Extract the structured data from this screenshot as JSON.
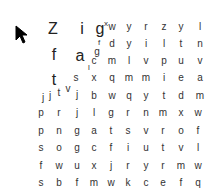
{
  "game": {
    "type": "letter-grid",
    "cursor": "arrow-cursor-icon",
    "floating_letters": [
      {
        "ch": "Z",
        "x": 53,
        "y": 29,
        "size": "l"
      },
      {
        "ch": "i",
        "x": 82,
        "y": 29,
        "size": "l"
      },
      {
        "ch": "g",
        "x": 100,
        "y": 29,
        "size": "l"
      },
      {
        "ch": "x",
        "x": 106,
        "y": 24,
        "size": "s"
      },
      {
        "ch": "f",
        "x": 54,
        "y": 55,
        "size": "l"
      },
      {
        "ch": "a",
        "x": 80,
        "y": 56,
        "size": "l"
      },
      {
        "ch": "g",
        "x": 97,
        "y": 52,
        "size": "m"
      },
      {
        "ch": "f",
        "x": 99,
        "y": 43,
        "size": "s"
      },
      {
        "ch": "l",
        "x": 89,
        "y": 68,
        "size": "s"
      },
      {
        "ch": "t",
        "x": 54,
        "y": 80,
        "size": "l"
      },
      {
        "ch": "s",
        "x": 76,
        "y": 78,
        "size": "m"
      },
      {
        "ch": "j",
        "x": 43,
        "y": 98,
        "size": "m"
      },
      {
        "ch": "j",
        "x": 50,
        "y": 96,
        "size": "m"
      },
      {
        "ch": "t",
        "x": 59,
        "y": 93,
        "size": "m"
      },
      {
        "ch": "v",
        "x": 68,
        "y": 89,
        "size": "m"
      },
      {
        "ch": "j",
        "x": 77,
        "y": 95,
        "size": "m"
      }
    ],
    "grid_cols_x": [
      94,
      112,
      129,
      146,
      164,
      181,
      200
    ],
    "grid_rows": [
      {
        "y": 27,
        "letters": [
          "",
          "w",
          "y",
          "r",
          "z",
          "y",
          "l"
        ]
      },
      {
        "y": 44,
        "letters": [
          "",
          "d",
          "y",
          "i",
          "l",
          "t",
          "n"
        ]
      },
      {
        "y": 61,
        "letters": [
          "c",
          "m",
          "l",
          "v",
          "p",
          "u",
          "v"
        ]
      },
      {
        "y": 78,
        "letters": [
          "x",
          "q",
          "m",
          "m",
          "i",
          "e",
          "a"
        ]
      },
      {
        "y": 96,
        "letters": [
          "b",
          "w",
          "q",
          "y",
          "t",
          "d",
          "m"
        ]
      }
    ],
    "lower_cols_x": [
      41,
      59,
      77,
      94,
      111,
      128,
      146,
      163,
      181,
      198
    ],
    "lower_rows": [
      {
        "y": 113,
        "letters": [
          "p",
          "r",
          "j",
          "l",
          "g",
          "r",
          "n",
          "m",
          "x",
          "w"
        ]
      },
      {
        "y": 131,
        "letters": [
          "p",
          "n",
          "g",
          "a",
          "t",
          "s",
          "v",
          "r",
          "o",
          "f"
        ]
      },
      {
        "y": 148,
        "letters": [
          "s",
          "o",
          "g",
          "c",
          "f",
          "i",
          "u",
          "t",
          "v",
          "l"
        ]
      },
      {
        "y": 166,
        "letters": [
          "f",
          "w",
          "u",
          "x",
          "j",
          "r",
          "y",
          "r",
          "m",
          "w"
        ]
      },
      {
        "y": 183,
        "letters": [
          "s",
          "b",
          "f",
          "m",
          "w",
          "k",
          "c",
          "e",
          "f",
          "q"
        ]
      }
    ]
  }
}
